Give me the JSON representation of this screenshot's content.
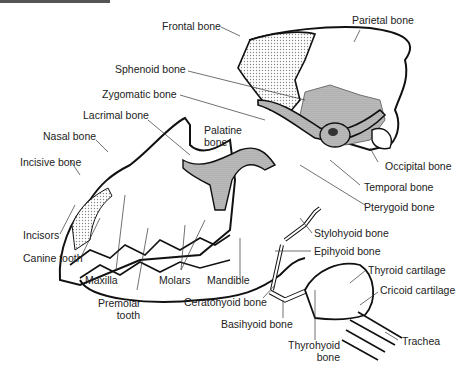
{
  "diagram": {
    "colors": {
      "outline": "#111111",
      "stipple_light": "#d9d9d9",
      "stipple_dark": "#b0b0b0",
      "label_text": "#222222",
      "leader_line": "#333333"
    },
    "labels": {
      "frontal": "Frontal bone",
      "parietal": "Parietal bone",
      "sphenoid": "Sphenoid bone",
      "zygomatic": "Zygomatic bone",
      "lacrimal": "Lacrimal bone",
      "palatine_1": "Palatine",
      "palatine_2": "bone",
      "nasal": "Nasal bone",
      "incisive": "Incisive bone",
      "occipital": "Occipital bone",
      "temporal": "Temporal bone",
      "pterygoid": "Pterygoid bone",
      "incisors": "Incisors",
      "canine": "Canine tooth",
      "maxilla": "Maxilla",
      "premolar_1": "Premolar",
      "premolar_2": "tooth",
      "molars": "Molars",
      "mandible": "Mandible",
      "stylohyoid": "Stylohyoid bone",
      "epihyoid": "Epihyoid bone",
      "ceratohyoid": "Ceratohyoid bone",
      "basihyoid": "Basihyoid bone",
      "thyrohyoid_1": "Thyrohyoid",
      "thyrohyoid_2": "bone",
      "thyroid_cart": "Thyroid cartilage",
      "cricoid_cart": "Cricoid cartilage",
      "trachea": "Trachea"
    }
  }
}
